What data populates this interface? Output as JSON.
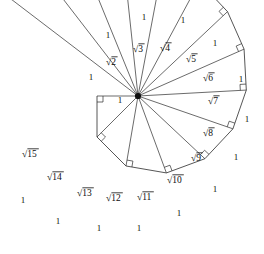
{
  "figure": {
    "name": "spiral-of-theodorus",
    "background_color": "#ffffff",
    "stroke_color": "#2b2b2b",
    "text_color": "#0d0d0d",
    "unit_label": "1",
    "radical_glyph": "√",
    "center": {
      "x": 138,
      "y": 96
    },
    "unit_length_px": 41,
    "start_angle_deg": 180,
    "triangle_count": 14,
    "right_angle_marker_size_px": 6
  },
  "chart_data": {
    "type": "diagram",
    "unit_leg_label": "1",
    "hypotenuse_labels": [
      "√2",
      "√3",
      "√4",
      "√5",
      "√6",
      "√7",
      "√8",
      "√9",
      "√10",
      "√11",
      "√12",
      "√13",
      "√14",
      "√15"
    ],
    "hypotenuse_values": [
      1.41421356,
      1.73205081,
      2.0,
      2.23606798,
      2.44948974,
      2.64575131,
      2.82842712,
      3.0,
      3.16227766,
      3.31662479,
      3.46410162,
      3.60555128,
      3.74165739,
      3.87298335
    ],
    "radicands": [
      2,
      3,
      4,
      5,
      6,
      7,
      8,
      9,
      10,
      11,
      12,
      13,
      14,
      15
    ],
    "initial_legs": {
      "horizontal": "1",
      "vertical": "1",
      "hypotenuse": "√2"
    },
    "unit_edge_count": 15,
    "right_angle_count": 15
  },
  "labels": {
    "roots": [
      {
        "text": "√2",
        "radicand": "2",
        "x": 106,
        "y": 65
      },
      {
        "text": "√3",
        "radicand": "3",
        "x": 133,
        "y": 52
      },
      {
        "text": "√4",
        "radicand": "4",
        "x": 160,
        "y": 51
      },
      {
        "text": "√5",
        "radicand": "5",
        "x": 186,
        "y": 62
      },
      {
        "text": "√6",
        "radicand": "6",
        "x": 203,
        "y": 81
      },
      {
        "text": "√7",
        "radicand": "7",
        "x": 208,
        "y": 104
      },
      {
        "text": "√8",
        "radicand": "8",
        "x": 203,
        "y": 136
      },
      {
        "text": "√9",
        "radicand": "9",
        "x": 191,
        "y": 161
      },
      {
        "text": "√10",
        "radicand": "10",
        "x": 167,
        "y": 183
      },
      {
        "text": "√11",
        "radicand": "11",
        "x": 137,
        "y": 200
      },
      {
        "text": "√12",
        "radicand": "12",
        "x": 106,
        "y": 201
      },
      {
        "text": "√13",
        "radicand": "13",
        "x": 77,
        "y": 196
      },
      {
        "text": "√14",
        "radicand": "14",
        "x": 47,
        "y": 180
      },
      {
        "text": "√15",
        "radicand": "15",
        "x": 22,
        "y": 157
      }
    ],
    "units": [
      {
        "text": "1",
        "x": 91,
        "y": 80
      },
      {
        "text": "1",
        "x": 120,
        "y": 103
      },
      {
        "text": "1",
        "x": 108,
        "y": 38
      },
      {
        "text": "1",
        "x": 144,
        "y": 20
      },
      {
        "text": "1",
        "x": 183,
        "y": 23
      },
      {
        "text": "1",
        "x": 215,
        "y": 46
      },
      {
        "text": "1",
        "x": 241,
        "y": 82
      },
      {
        "text": "1",
        "x": 247,
        "y": 122
      },
      {
        "text": "1",
        "x": 236,
        "y": 160
      },
      {
        "text": "1",
        "x": 215,
        "y": 192
      },
      {
        "text": "1",
        "x": 179,
        "y": 216
      },
      {
        "text": "1",
        "x": 139,
        "y": 231
      },
      {
        "text": "1",
        "x": 99,
        "y": 231
      },
      {
        "text": "1",
        "x": 58,
        "y": 224
      },
      {
        "text": "1",
        "x": 23,
        "y": 203
      }
    ]
  }
}
